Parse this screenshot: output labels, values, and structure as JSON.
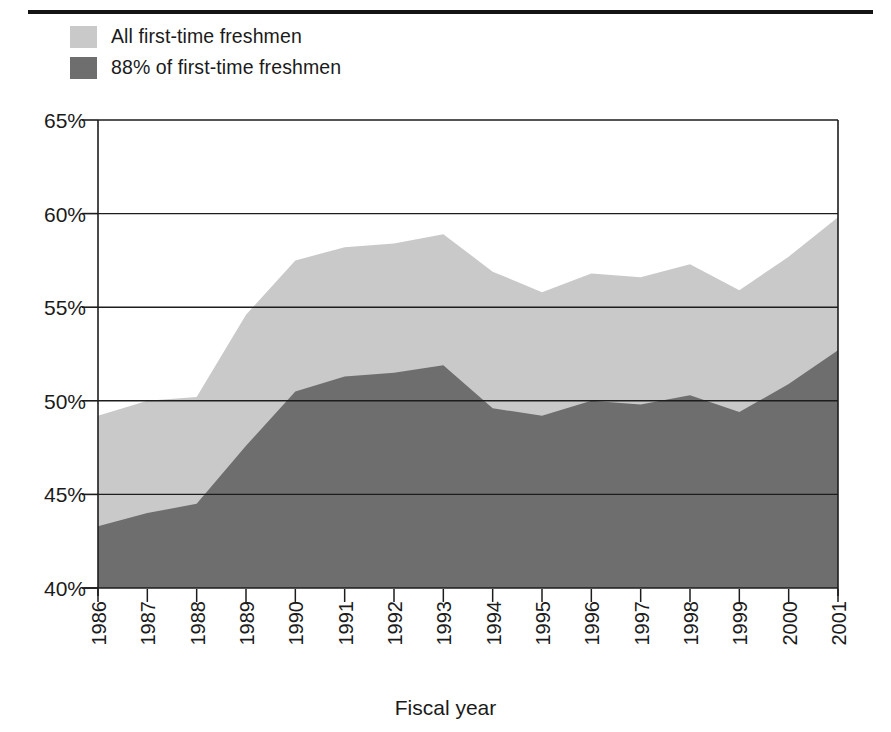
{
  "chart_data": {
    "type": "area",
    "stacked": false,
    "title": "",
    "xlabel": "Fiscal year",
    "ylabel": "",
    "categories": [
      "1986",
      "1987",
      "1988",
      "1989",
      "1990",
      "1991",
      "1992",
      "1993",
      "1994",
      "1995",
      "1996",
      "1997",
      "1998",
      "1999",
      "2000",
      "2001"
    ],
    "ylim": [
      40,
      65
    ],
    "yticks": [
      40,
      45,
      50,
      55,
      60,
      65
    ],
    "ytick_labels": [
      "40%",
      "45%",
      "50%",
      "55%",
      "60%",
      "65%"
    ],
    "grid": true,
    "legend_position": "top-left",
    "series": [
      {
        "name": "All first-time freshmen",
        "color": "#c9c9c9",
        "values": [
          49.2,
          50.0,
          50.2,
          54.6,
          57.5,
          58.2,
          58.4,
          58.9,
          56.9,
          55.8,
          56.8,
          56.6,
          57.3,
          55.9,
          57.7,
          59.8
        ]
      },
      {
        "name": "88% of first-time freshmen",
        "color": "#6e6e6e",
        "values": [
          43.3,
          44.0,
          44.5,
          47.6,
          50.5,
          51.3,
          51.5,
          51.9,
          49.6,
          49.2,
          50.0,
          49.8,
          50.3,
          49.4,
          50.9,
          52.7
        ]
      }
    ]
  },
  "legend": {
    "items": [
      {
        "label": "All first-time freshmen",
        "color": "#c9c9c9"
      },
      {
        "label": "88% of first-time freshmen",
        "color": "#6e6e6e"
      }
    ]
  },
  "axes": {
    "x_title": "Fiscal year"
  }
}
